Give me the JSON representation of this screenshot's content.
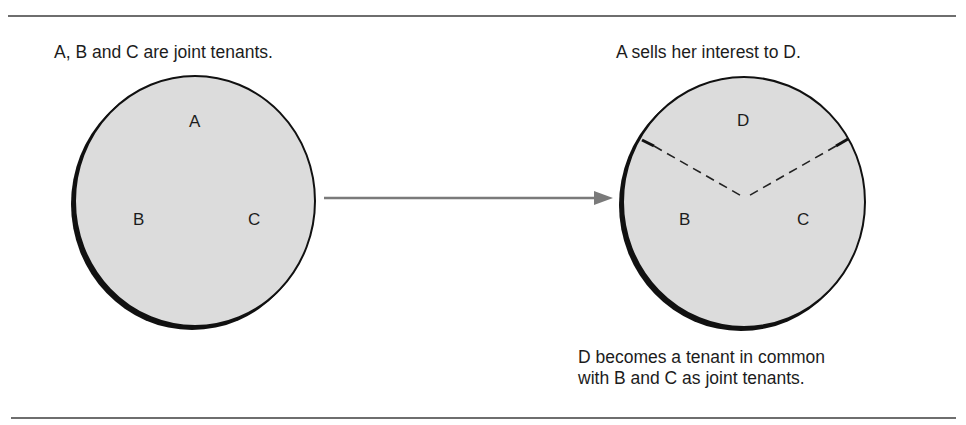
{
  "diagram": {
    "left_panel": {
      "caption": "A, B and C are joint tenants.",
      "labels": {
        "top": "A",
        "left": "B",
        "right": "C"
      }
    },
    "right_panel": {
      "caption": "A sells her interest to D.",
      "labels": {
        "top": "D",
        "left": "B",
        "right": "C"
      },
      "footnote_line1": "D becomes a tenant in common",
      "footnote_line2": "with B and C as joint tenants."
    },
    "colors": {
      "circle_fill": "#dcdcdc",
      "circle_stroke": "#111111",
      "arrow": "#7a7a7a",
      "rule": "#6e6e6e"
    }
  }
}
